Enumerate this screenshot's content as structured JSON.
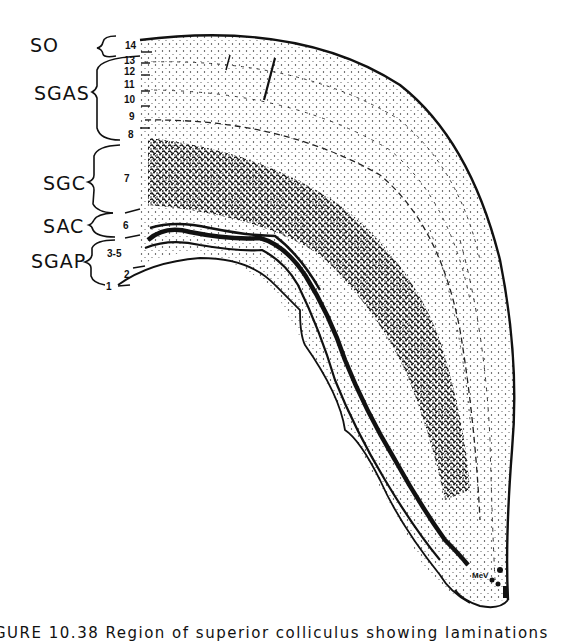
{
  "figure": {
    "layer_groups": [
      {
        "label": "SO",
        "sublayers": [
          "14"
        ]
      },
      {
        "label": "SGAS",
        "sublayers": [
          "13",
          "12",
          "11",
          "10",
          "9",
          "8"
        ]
      },
      {
        "label": "SGC",
        "sublayers": [
          "7"
        ]
      },
      {
        "label": "SAC",
        "sublayers": [
          "6"
        ]
      },
      {
        "label": "SGAP",
        "sublayers": [
          "3-5",
          "2",
          "1"
        ]
      }
    ],
    "labels": {
      "so": "SO",
      "sgas": "SGAS",
      "sgc": "SGC",
      "sac": "SAC",
      "sgap": "SGAP"
    },
    "numbers": {
      "n14": "14",
      "n13": "13",
      "n12": "12",
      "n11": "11",
      "n10": "10",
      "n9": "9",
      "n8": "8",
      "n7": "7",
      "n6": "6",
      "n3_5": "3-5",
      "n2": "2",
      "n1": "1"
    },
    "annotation": "MeV",
    "caption": "GURE 10.38  Region of superior colliculus showing laminations"
  }
}
